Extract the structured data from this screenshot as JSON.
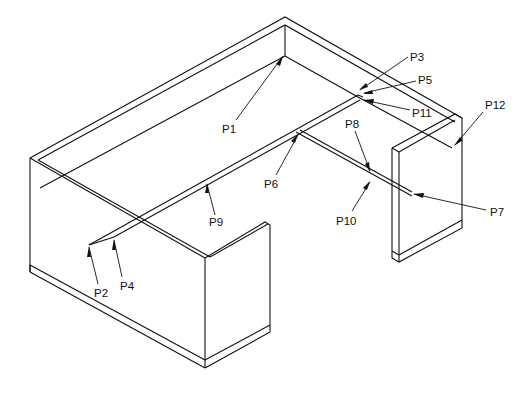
{
  "diagram": {
    "type": "isometric furniture line drawing (desk with wall panels)",
    "callouts": [
      {
        "id": "p1",
        "label": "P1",
        "text_x": 226,
        "text_y": 133,
        "tip": [
          283,
          56
        ],
        "tail": [
          236,
          120
        ]
      },
      {
        "id": "p2",
        "label": "P2",
        "text_x": 96,
        "text_y": 297,
        "tip": [
          89,
          245
        ],
        "tail": [
          98,
          284
        ]
      },
      {
        "id": "p3",
        "label": "P3",
        "text_x": 410,
        "text_y": 60,
        "tip": [
          359,
          90
        ],
        "tail": [
          408,
          57
        ]
      },
      {
        "id": "p4",
        "label": "P4",
        "text_x": 120,
        "text_y": 290,
        "tip": [
          114,
          237
        ],
        "tail": [
          122,
          277
        ]
      },
      {
        "id": "p5",
        "label": "P5",
        "text_x": 418,
        "text_y": 84,
        "tip": [
          363,
          94
        ],
        "tail": [
          416,
          81
        ]
      },
      {
        "id": "p6",
        "label": "P6",
        "text_x": 264,
        "text_y": 188,
        "tip": [
          298,
          134
        ],
        "tail": [
          276,
          175
        ]
      },
      {
        "id": "p7",
        "label": "P7",
        "text_x": 490,
        "text_y": 216,
        "tip": [
          413,
          194
        ],
        "tail": [
          486,
          210
        ]
      },
      {
        "id": "p8",
        "label": "P8",
        "text_x": 345,
        "text_y": 128,
        "tip": [
          370,
          172
        ],
        "tail": [
          355,
          131
        ]
      },
      {
        "id": "p9",
        "label": "P9",
        "text_x": 210,
        "text_y": 226,
        "tip": [
          207,
          183
        ],
        "tail": [
          215,
          215
        ]
      },
      {
        "id": "p10",
        "label": "P10",
        "text_x": 337,
        "text_y": 225,
        "tip": [
          370,
          181
        ],
        "tail": [
          352,
          211
        ]
      },
      {
        "id": "p11",
        "label": "P11",
        "text_x": 412,
        "text_y": 117,
        "tip": [
          363,
          100
        ],
        "tail": [
          410,
          110
        ]
      },
      {
        "id": "p12",
        "label": "P12",
        "text_x": 485,
        "text_y": 109,
        "tip": [
          454,
          146
        ],
        "tail": [
          483,
          112
        ]
      }
    ],
    "colors": {
      "line": "#111111",
      "background": "#ffffff"
    }
  }
}
